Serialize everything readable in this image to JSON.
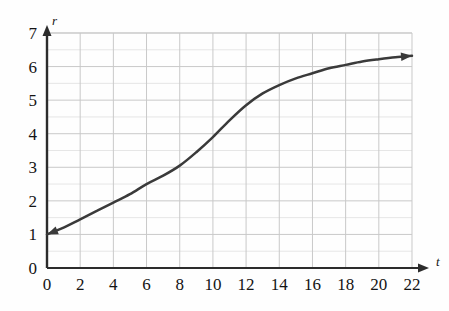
{
  "chart_data": {
    "type": "line",
    "title": "",
    "subtitle": "",
    "xlabel": "t",
    "ylabel": "r",
    "xlim": [
      0,
      22
    ],
    "ylim": [
      0,
      7
    ],
    "xticks": [
      0,
      2,
      4,
      6,
      8,
      10,
      12,
      14,
      16,
      18,
      20,
      22
    ],
    "xtick_labels": [
      "0",
      "2",
      "4",
      "6",
      "8",
      "10",
      "12",
      "14",
      "16",
      "18",
      "20",
      "22"
    ],
    "yticks": [
      0,
      1,
      2,
      3,
      4,
      5,
      6,
      7
    ],
    "ytick_labels": [
      "0",
      "1",
      "2",
      "3",
      "4",
      "5",
      "6",
      "7"
    ],
    "grid": true,
    "grid_major_x_step": 2,
    "grid_minor_y_step": 0.5,
    "grid_major_y_step": 1,
    "legend": null,
    "legend_position": "none",
    "arrowheads": [
      "start",
      "end"
    ],
    "series": [
      {
        "name": "r(t)",
        "color": "#3a3a3a",
        "x": [
          0,
          1,
          2,
          3,
          4,
          5,
          6,
          7,
          8,
          9,
          10,
          11,
          12,
          13,
          14,
          15,
          16,
          17,
          18,
          19,
          20,
          21,
          22
        ],
        "values": [
          1.0,
          1.2,
          1.45,
          1.7,
          1.95,
          2.2,
          2.5,
          2.75,
          3.05,
          3.45,
          3.9,
          4.4,
          4.85,
          5.2,
          5.45,
          5.65,
          5.8,
          5.95,
          6.05,
          6.15,
          6.22,
          6.28,
          6.32
        ]
      }
    ],
    "annotations": []
  },
  "axis": {
    "x_label": "t",
    "y_label": "r"
  },
  "colors": {
    "curve": "#3a3a3a",
    "axis": "#2c2c2c",
    "grid_major": "#c9c9c9",
    "grid_minor": "#e6e6e6",
    "text": "#141414",
    "background": "#fefefe"
  }
}
